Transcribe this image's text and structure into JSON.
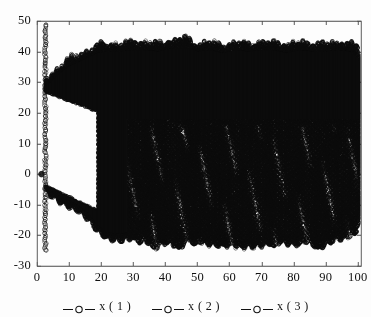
{
  "chart_data": {
    "type": "line",
    "title": "",
    "subtitle": "",
    "xlabel": "",
    "ylabel": "",
    "xlim": [
      0,
      101
    ],
    "ylim": [
      -30,
      50
    ],
    "xticks": [
      0,
      10,
      20,
      30,
      40,
      50,
      60,
      70,
      80,
      90,
      100
    ],
    "xtick_labels": [
      "0",
      "10",
      "20",
      "30",
      "40",
      "50",
      "60",
      "70",
      "80",
      "90",
      "100"
    ],
    "yticks": [
      -30,
      -20,
      -10,
      0,
      10,
      20,
      30,
      40,
      50
    ],
    "ytick_labels": [
      "-30",
      "-20",
      "-10",
      "0",
      "10",
      "20",
      "30",
      "40",
      "50"
    ],
    "grid": false,
    "legend_position": "below-axes",
    "marker": "circle-open",
    "line_style": "solid",
    "series_color": "#0d0d0d",
    "axes_color": "#4a4a4a",
    "background_color": "#fdfdfd",
    "series": [
      {
        "name": "x ( 1 )",
        "legend_label": "x ( 1 )",
        "marker": "circle-open",
        "color": "#0d0d0d"
      },
      {
        "name": "x ( 2 )",
        "legend_label": "x ( 2 )",
        "marker": "circle-open",
        "color": "#0d0d0d"
      },
      {
        "name": "x ( 3 )",
        "legend_label": "x ( 3 )",
        "marker": "circle-open",
        "color": "#0d0d0d"
      }
    ],
    "envelope": {
      "transient_column": {
        "t": 2.6,
        "ymin": -25.0,
        "ymax": 49.0,
        "n": 150
      },
      "initial_gap": {
        "t_start": 2.8,
        "t_end": 19.0,
        "inner_top_at_start": 27.0,
        "inner_bottom_at_start": -4.0,
        "inner_top_at_end": 20.5,
        "inner_bottom_at_end": -12.0
      },
      "upper_envelope_points": [
        [
          2.6,
          30.0
        ],
        [
          4.0,
          31.0
        ],
        [
          6.0,
          33.0
        ],
        [
          8.0,
          35.0
        ],
        [
          10.0,
          36.5
        ],
        [
          13.0,
          38.0
        ],
        [
          16.0,
          39.5
        ],
        [
          19.0,
          41.0
        ],
        [
          22.0,
          41.5
        ],
        [
          26.0,
          41.5
        ],
        [
          30.0,
          42.0
        ],
        [
          34.0,
          42.0
        ],
        [
          38.0,
          41.5
        ],
        [
          42.0,
          42.5
        ],
        [
          46.0,
          43.5
        ],
        [
          50.0,
          41.5
        ],
        [
          54.0,
          42.0
        ],
        [
          58.0,
          41.0
        ],
        [
          62.0,
          42.0
        ],
        [
          66.0,
          41.5
        ],
        [
          70.0,
          42.0
        ],
        [
          74.0,
          42.0
        ],
        [
          78.0,
          41.0
        ],
        [
          82.0,
          42.0
        ],
        [
          86.0,
          41.5
        ],
        [
          90.0,
          41.5
        ],
        [
          94.0,
          42.0
        ],
        [
          98.0,
          41.5
        ],
        [
          101.0,
          38.0
        ]
      ],
      "lower_envelope_points": [
        [
          2.6,
          -5.0
        ],
        [
          4.0,
          -6.0
        ],
        [
          6.0,
          -7.5
        ],
        [
          8.0,
          -9.0
        ],
        [
          10.0,
          -10.0
        ],
        [
          13.0,
          -11.5
        ],
        [
          16.0,
          -14.0
        ],
        [
          19.0,
          -18.0
        ],
        [
          22.0,
          -20.5
        ],
        [
          26.0,
          -21.0
        ],
        [
          30.0,
          -20.0
        ],
        [
          34.0,
          -21.0
        ],
        [
          37.0,
          -23.5
        ],
        [
          41.0,
          -21.0
        ],
        [
          44.0,
          -23.5
        ],
        [
          48.0,
          -20.5
        ],
        [
          52.0,
          -22.0
        ],
        [
          56.0,
          -22.5
        ],
        [
          60.0,
          -22.5
        ],
        [
          64.0,
          -23.0
        ],
        [
          68.0,
          -23.0
        ],
        [
          72.0,
          -22.0
        ],
        [
          76.0,
          -21.5
        ],
        [
          80.0,
          -22.5
        ],
        [
          84.0,
          -21.0
        ],
        [
          88.0,
          -23.5
        ],
        [
          92.0,
          -21.0
        ],
        [
          96.0,
          -20.0
        ],
        [
          99.0,
          -19.0
        ],
        [
          101.0,
          -12.0
        ]
      ],
      "spike_tops": [
        [
          20.5,
          42.5
        ],
        [
          23.0,
          42.0
        ],
        [
          26.5,
          41.0
        ],
        [
          30.5,
          43.0
        ],
        [
          32.5,
          42.5
        ],
        [
          36.5,
          42.5
        ],
        [
          41.0,
          43.0
        ],
        [
          44.5,
          44.0
        ],
        [
          49.0,
          42.0
        ],
        [
          53.0,
          42.5
        ],
        [
          57.5,
          41.5
        ],
        [
          60.5,
          42.0
        ],
        [
          64.0,
          42.5
        ],
        [
          68.0,
          42.0
        ],
        [
          72.5,
          42.5
        ],
        [
          77.0,
          42.0
        ],
        [
          81.5,
          42.5
        ],
        [
          86.0,
          42.0
        ],
        [
          90.5,
          42.0
        ],
        [
          95.0,
          42.5
        ],
        [
          99.5,
          42.0
        ]
      ],
      "downspikes": [
        [
          30.5,
          -20.5
        ],
        [
          32.0,
          -22.0
        ],
        [
          36.5,
          -23.5
        ],
        [
          40.5,
          -22.0
        ],
        [
          44.2,
          -23.5
        ],
        [
          49.0,
          -22.5
        ],
        [
          53.8,
          -22.5
        ],
        [
          58.0,
          -22.5
        ],
        [
          60.2,
          -22.5
        ],
        [
          63.8,
          -23.0
        ],
        [
          67.5,
          -23.0
        ],
        [
          72.0,
          -22.0
        ],
        [
          73.8,
          -23.0
        ],
        [
          78.0,
          -22.0
        ],
        [
          81.5,
          -22.5
        ],
        [
          84.0,
          -22.0
        ],
        [
          87.5,
          -23.5
        ],
        [
          91.5,
          -22.0
        ],
        [
          95.5,
          -20.0
        ],
        [
          99.0,
          -19.0
        ]
      ],
      "band_quiet_band": {
        "ymin": 18.0,
        "ymax": 35.0,
        "note": "mid-band stays solid across whole record"
      }
    }
  },
  "axes": {
    "plot_left_px": 37,
    "plot_right_px": 361,
    "plot_top_px": 21,
    "plot_bottom_px": 266
  },
  "legend": {
    "entries": [
      {
        "label": "x ( 1 )",
        "marker": "circle-open"
      },
      {
        "label": "x ( 2 )",
        "marker": "circle-open"
      },
      {
        "label": "x ( 3 )",
        "marker": "circle-open"
      }
    ]
  }
}
